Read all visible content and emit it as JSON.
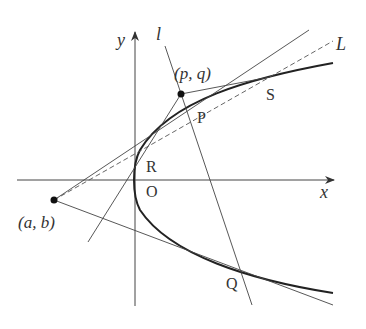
{
  "diagram": {
    "type": "parabola with tangent lines",
    "axes": {
      "x_label": "x",
      "y_label": "y",
      "origin_label": "O"
    },
    "points": {
      "external_point_1": "(a, b)",
      "external_point_2": "(p, q)",
      "tangent_points": [
        "R",
        "S",
        "P",
        "Q"
      ]
    },
    "lines": {
      "line_l_label": "l",
      "dashed_line_label": "L"
    },
    "colors": {
      "ink": "#333333",
      "curve": "#222222",
      "background": "#ffffff"
    }
  },
  "labels": {
    "y": "y",
    "x": "x",
    "l": "l",
    "L": "L",
    "O": "O",
    "R": "R",
    "P": "P",
    "S": "S",
    "Q": "Q",
    "pq": "(p, q)",
    "ab": "(a, b)"
  }
}
